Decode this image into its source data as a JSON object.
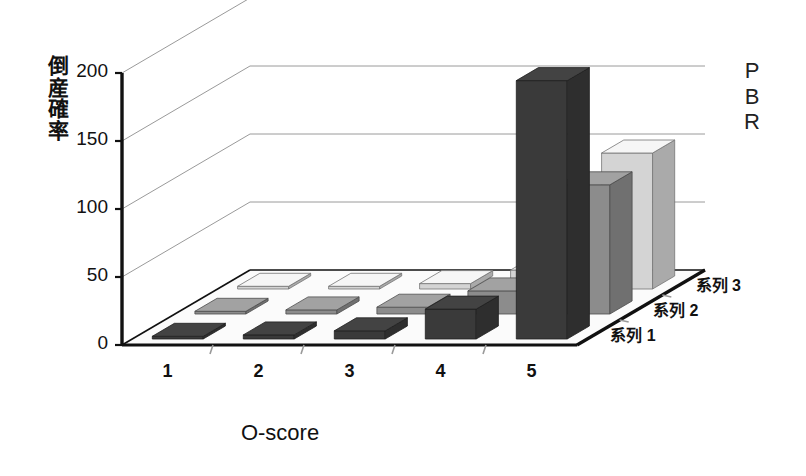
{
  "chart_data": {
    "type": "bar",
    "subtype": "3d-grouped-column",
    "title": "",
    "ylabel": "倒産確率",
    "xlabel": "O-score",
    "zlabel": "PBR",
    "categories": [
      "1",
      "2",
      "3",
      "4",
      "5"
    ],
    "ylim": [
      0,
      200
    ],
    "yticks": [
      0,
      50,
      100,
      150,
      200
    ],
    "ytick_labels": [
      "0",
      "50",
      "100",
      "150",
      "200"
    ],
    "grid": true,
    "legend_position": "depth-axis-right",
    "series": [
      {
        "name": "系列 1",
        "color": "#3a3a3a",
        "values": [
          2,
          3,
          6,
          22,
          190
        ]
      },
      {
        "name": "系列 2",
        "color": "#8c8c8c",
        "values": [
          2,
          3,
          5,
          17,
          95
        ]
      },
      {
        "name": "系列 3",
        "color": "#d4d4d4",
        "values": [
          2,
          2,
          4,
          14,
          100
        ]
      }
    ]
  },
  "axis": {
    "y_title_chars": [
      "倒",
      "産",
      "確",
      "率"
    ],
    "z_title_chars": [
      "P",
      "B",
      "R"
    ],
    "x_title": "O-score"
  },
  "colors": {
    "series1": "#3a3a3a",
    "series2": "#8c8c8c",
    "series3": "#d4d4d4",
    "axis_line": "#111111",
    "gridline": "#9a9a9a",
    "background": "#ffffff",
    "floor": "#fbfbfb"
  }
}
